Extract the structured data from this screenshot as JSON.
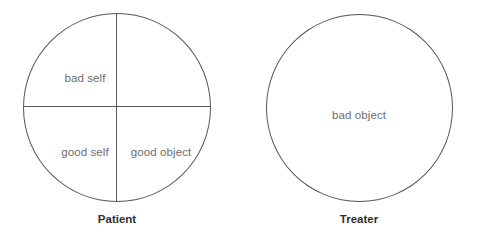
{
  "diagram": {
    "background_color": "#ffffff",
    "line_color": "#575757",
    "label_color": "#6d6d6d",
    "caption_color": "#2f2f2f",
    "figures": [
      {
        "id": "patient",
        "caption": "Patient",
        "shape": "circle-quartered",
        "quadrants": {
          "upper_left": "bad self",
          "upper_right": "",
          "lower_left": "good self",
          "lower_right": "good object"
        }
      },
      {
        "id": "treater",
        "caption": "Treater",
        "shape": "circle",
        "center_label": "bad object"
      }
    ]
  }
}
